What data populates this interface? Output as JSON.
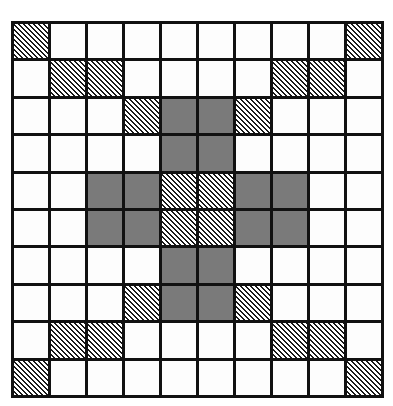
{
  "diagram": {
    "type": "grid-pattern",
    "rows": 10,
    "cols": 10,
    "legend": {
      "W": "white (empty)",
      "H": "hatched (diagonal lines)",
      "G": "gray (solid fill)"
    },
    "colors": {
      "grid_line": "#111111",
      "white": "#fdfdfd",
      "gray": "#7a7a7a",
      "hatch_line": "#1a1a1a"
    },
    "cells": [
      [
        "H",
        "W",
        "W",
        "W",
        "W",
        "W",
        "W",
        "W",
        "W",
        "H"
      ],
      [
        "W",
        "H",
        "H",
        "W",
        "W",
        "W",
        "W",
        "H",
        "H",
        "W"
      ],
      [
        "W",
        "W",
        "W",
        "H",
        "G",
        "G",
        "H",
        "W",
        "W",
        "W"
      ],
      [
        "W",
        "W",
        "W",
        "W",
        "G",
        "G",
        "W",
        "W",
        "W",
        "W"
      ],
      [
        "W",
        "W",
        "G",
        "G",
        "H",
        "H",
        "G",
        "G",
        "W",
        "W"
      ],
      [
        "W",
        "W",
        "G",
        "G",
        "H",
        "H",
        "G",
        "G",
        "W",
        "W"
      ],
      [
        "W",
        "W",
        "W",
        "W",
        "G",
        "G",
        "W",
        "W",
        "W",
        "W"
      ],
      [
        "W",
        "W",
        "W",
        "H",
        "G",
        "G",
        "H",
        "W",
        "W",
        "W"
      ],
      [
        "W",
        "H",
        "H",
        "W",
        "W",
        "W",
        "W",
        "H",
        "H",
        "W"
      ],
      [
        "H",
        "W",
        "W",
        "W",
        "W",
        "W",
        "W",
        "W",
        "W",
        "H"
      ]
    ]
  }
}
